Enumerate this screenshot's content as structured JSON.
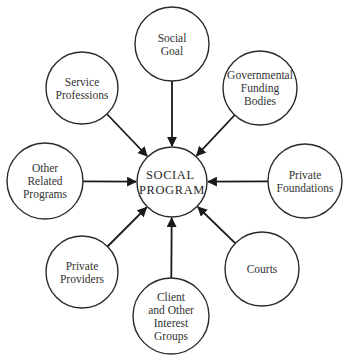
{
  "center": {
    "lines": [
      "SOCIAL",
      "PROGRAM"
    ],
    "cx": 172,
    "cy": 182,
    "r": 35
  },
  "nodes": [
    {
      "id": "social-goal",
      "lines": [
        "Social",
        "Goal"
      ],
      "cx": 172,
      "cy": 44,
      "r": 37
    },
    {
      "id": "governmental-funding-bodies",
      "lines": [
        "Governmental",
        "Funding",
        "Bodies"
      ],
      "cx": 260,
      "cy": 88,
      "r": 37
    },
    {
      "id": "private-foundations",
      "lines": [
        "Private",
        "Foundations"
      ],
      "cx": 305,
      "cy": 181,
      "r": 37
    },
    {
      "id": "courts",
      "lines": [
        "Courts"
      ],
      "cx": 262,
      "cy": 269,
      "r": 37
    },
    {
      "id": "client-and-other-interest-groups",
      "lines": [
        "Client",
        "and Other",
        "Interest",
        "Groups"
      ],
      "cx": 171,
      "cy": 316,
      "r": 38
    },
    {
      "id": "private-providers",
      "lines": [
        "Private",
        "Providers"
      ],
      "cx": 82,
      "cy": 272,
      "r": 36
    },
    {
      "id": "other-related-programs",
      "lines": [
        "Other",
        "Related",
        "Programs"
      ],
      "cx": 45,
      "cy": 181,
      "r": 38
    },
    {
      "id": "service-professions",
      "lines": [
        "Service",
        "Professions"
      ],
      "cx": 82,
      "cy": 88,
      "r": 36
    }
  ],
  "edges": {
    "direction": "into-center",
    "arrowhead": "filled"
  },
  "colors": {
    "stroke": "#2a2a2a",
    "text": "#333333",
    "background": "#ffffff"
  }
}
